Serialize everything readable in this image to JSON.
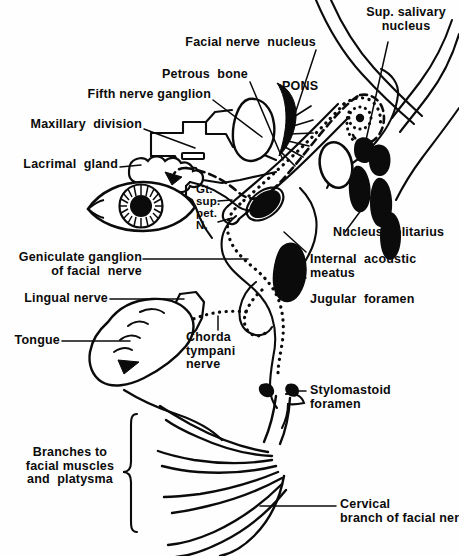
{
  "figure": {
    "width": 459,
    "height": 556,
    "ink_color": "#0b0b0b",
    "paper_color": "#fefefe"
  },
  "labels": {
    "sup_salivary_nucleus": "Sup. salivary\nnucleus",
    "facial_nerve_nucleus": "Facial nerve  nucleus",
    "petrous_bone": "Petrous  bone",
    "pons": "PONS",
    "fifth_nerve_ganglion": "Fifth nerve ganglion",
    "maxillary_division": "Maxillary  division",
    "lacrimal_gland": "Lacrimal  gland",
    "gt_sup_pet_n": "Gt.\nsup.\npet.\nN.",
    "nucleus_solitarius": "Nucleus solitarius",
    "internal_acoustic_meatus": "Internal  acoustic\nmeatus",
    "jugular_foramen": "Jugular  foramen",
    "geniculate_ganglion": "Geniculate ganglion\nof facial  nerve",
    "lingual_nerve": "Lingual nerve",
    "tongue": "Tongue",
    "chorda_tympani_nerve": "Chorda\ntympani\nnerve",
    "stylomastoid_foramen": "Stylomastoid\nforamen",
    "branches_to_facial_muscles": "Branches to\nfacial muscles\nand  platysma",
    "cervical_branch": "Cervical\nbranch of facial nerve"
  }
}
